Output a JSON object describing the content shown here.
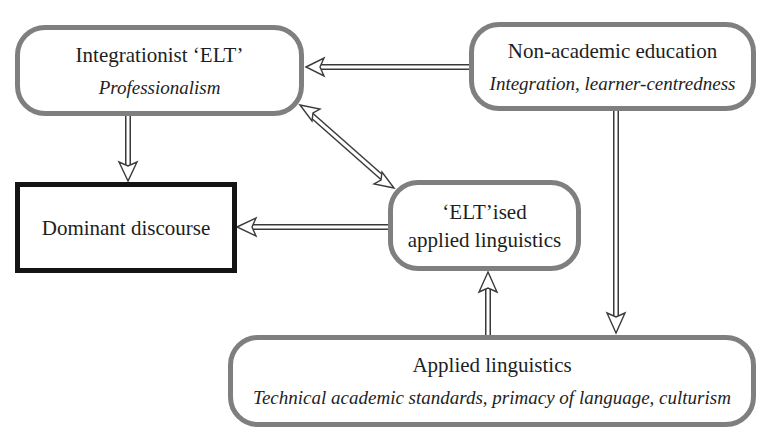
{
  "nodes": {
    "integrationist_elt": {
      "title": "Integrationist ‘ELT’",
      "subtitle": "Professionalism"
    },
    "non_academic_education": {
      "title": "Non-academic education",
      "subtitle": "Integration, learner-centredness"
    },
    "dominant_discourse": {
      "title": "Dominant discourse"
    },
    "eltised_applied_linguistics": {
      "title_line1": "‘ELT’ised",
      "title_line2": "applied linguistics"
    },
    "applied_linguistics": {
      "title": "Applied linguistics",
      "subtitle": "Technical academic standards, primacy of language, culturism"
    }
  },
  "edges": [
    {
      "from": "Non-academic education",
      "to": "Integrationist ‘ELT’",
      "direction": "one-way"
    },
    {
      "from": "Integrationist ‘ELT’",
      "to": "Dominant discourse",
      "direction": "one-way"
    },
    {
      "from": "Integrationist ‘ELT’",
      "to": "‘ELT’ised applied linguistics",
      "direction": "two-way"
    },
    {
      "from": "‘ELT’ised applied linguistics",
      "to": "Dominant discourse",
      "direction": "one-way"
    },
    {
      "from": "Non-academic education",
      "to": "Applied linguistics",
      "direction": "one-way"
    },
    {
      "from": "Applied linguistics",
      "to": "‘ELT’ised applied linguistics",
      "direction": "one-way"
    }
  ],
  "colors": {
    "rounded_border": "#7f7f7f",
    "dominant_border": "#141414",
    "arrow": "#3a3a3a"
  }
}
